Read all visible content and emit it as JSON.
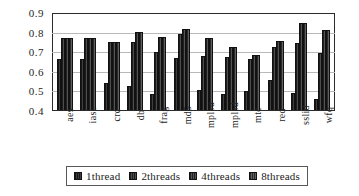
{
  "chart_data": {
    "type": "bar",
    "title": "",
    "xlabel": "",
    "ylabel": "",
    "ylim": [
      0.4,
      0.9
    ],
    "ytick_values": [
      0.9,
      0.8,
      0.7,
      0.6,
      0.5,
      0.4
    ],
    "ytick_labels": [
      "0.9",
      "0.8",
      "0.7",
      "0.6",
      "0.5",
      "0.4"
    ],
    "grid": true,
    "legend_position": "bottom",
    "categories": [
      "aes",
      "iase",
      "crc",
      "db",
      "frag",
      "md5",
      "mplsu",
      "mplsd",
      "mtc",
      "red",
      "sslid",
      "wfq"
    ],
    "series": [
      {
        "name": "1thread",
        "values": [
          0.66,
          0.66,
          0.54,
          0.525,
          0.48,
          0.665,
          0.5,
          0.483,
          0.495,
          0.555,
          0.488,
          0.455
        ]
      },
      {
        "name": "2threads",
        "values": [
          0.765,
          0.765,
          0.745,
          0.748,
          0.695,
          0.79,
          0.677,
          0.672,
          0.662,
          0.722,
          0.74,
          0.693
        ]
      },
      {
        "name": "4threads",
        "values": [
          0.768,
          0.768,
          0.747,
          0.8,
          0.772,
          0.813,
          0.768,
          0.722,
          0.68,
          0.753,
          0.842,
          0.806
        ]
      },
      {
        "name": "8threads",
        "values": [
          0.768,
          0.768,
          0.745,
          0.8,
          0.772,
          0.813,
          0.768,
          0.722,
          0.68,
          0.753,
          0.842,
          0.806
        ]
      }
    ]
  },
  "legend": {
    "items": [
      {
        "label": "1thread"
      },
      {
        "label": "2threads"
      },
      {
        "label": "4threads"
      },
      {
        "label": "8threads"
      }
    ]
  }
}
